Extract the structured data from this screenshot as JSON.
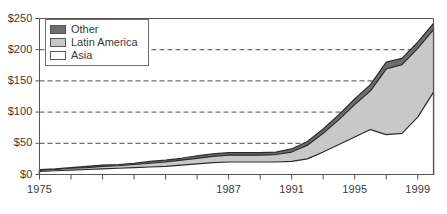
{
  "chart_data": {
    "type": "area",
    "stacked": true,
    "title": "",
    "xlabel": "",
    "ylabel": "",
    "xlim": [
      1975,
      2000
    ],
    "ylim": [
      0,
      250
    ],
    "ytick_labels": [
      "$0",
      "$50",
      "$100",
      "$150",
      "$200",
      "$250"
    ],
    "ytick_values": [
      0,
      50,
      100,
      150,
      200,
      250
    ],
    "xtick_labels": [
      "1975",
      "1987",
      "1991",
      "1995",
      "1999"
    ],
    "xtick_label_values": [
      1975,
      1987,
      1991,
      1995,
      1999
    ],
    "xtick_minor_values": [
      1975,
      1977,
      1979,
      1981,
      1983,
      1985,
      1987,
      1989,
      1991,
      1993,
      1995,
      1997,
      1999
    ],
    "grid": "horizontal-dashed",
    "gridlines_at": [
      50,
      100,
      150,
      200
    ],
    "legend_position": "top-left",
    "x": [
      1975,
      1976,
      1977,
      1978,
      1979,
      1980,
      1981,
      1982,
      1983,
      1984,
      1985,
      1986,
      1987,
      1988,
      1989,
      1990,
      1991,
      1992,
      1993,
      1994,
      1995,
      1996,
      1997,
      1998,
      1999,
      2000
    ],
    "series": [
      {
        "name": "Asia",
        "color": "#ffffff",
        "values": [
          5,
          6,
          7,
          8,
          9,
          10,
          11,
          12,
          13,
          15,
          17,
          19,
          20,
          20,
          20,
          20,
          21,
          25,
          36,
          48,
          60,
          72,
          64,
          66,
          92,
          132
        ]
      },
      {
        "name": "Latin America",
        "color": "#c8c8c8",
        "values": [
          2,
          2,
          3,
          3,
          4,
          4,
          5,
          6,
          7,
          8,
          9,
          10,
          11,
          11,
          11,
          12,
          15,
          22,
          30,
          40,
          52,
          62,
          105,
          110,
          110,
          100
        ]
      },
      {
        "name": "Other",
        "color": "#6e6e6e",
        "values": [
          1,
          1,
          1,
          2,
          2,
          2,
          2,
          3,
          3,
          3,
          4,
          4,
          4,
          4,
          4,
          4,
          5,
          6,
          7,
          8,
          9,
          10,
          11,
          10,
          10,
          10
        ]
      }
    ],
    "totals": [
      8,
      9,
      11,
      13,
      15,
      16,
      18,
      21,
      23,
      26,
      30,
      33,
      35,
      35,
      35,
      36,
      41,
      53,
      73,
      96,
      121,
      144,
      180,
      186,
      212,
      242
    ]
  },
  "legend": {
    "items": [
      {
        "label": "Other",
        "swatch_color": "#6e6e6e"
      },
      {
        "label": "Latin America",
        "swatch_color": "#c8c8c8"
      },
      {
        "label": "Asia",
        "swatch_color": "#ffffff"
      }
    ]
  },
  "style": {
    "axis_color": "#555555",
    "grid_color": "#4a4a4a",
    "band_outline": "#2b2b2b",
    "background": "#ffffff"
  }
}
